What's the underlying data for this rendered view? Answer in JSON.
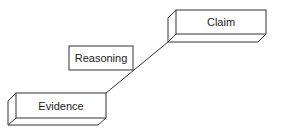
{
  "diagram": {
    "type": "staircase",
    "nodes": [
      {
        "id": "evidence",
        "label": "Evidence"
      },
      {
        "id": "reasoning",
        "label": "Reasoning"
      },
      {
        "id": "claim",
        "label": "Claim"
      }
    ],
    "connector": {
      "from": "evidence",
      "to": "claim",
      "annotated_by": "reasoning"
    },
    "colors": {
      "stroke": "#333333",
      "background": "#ffffff"
    }
  }
}
